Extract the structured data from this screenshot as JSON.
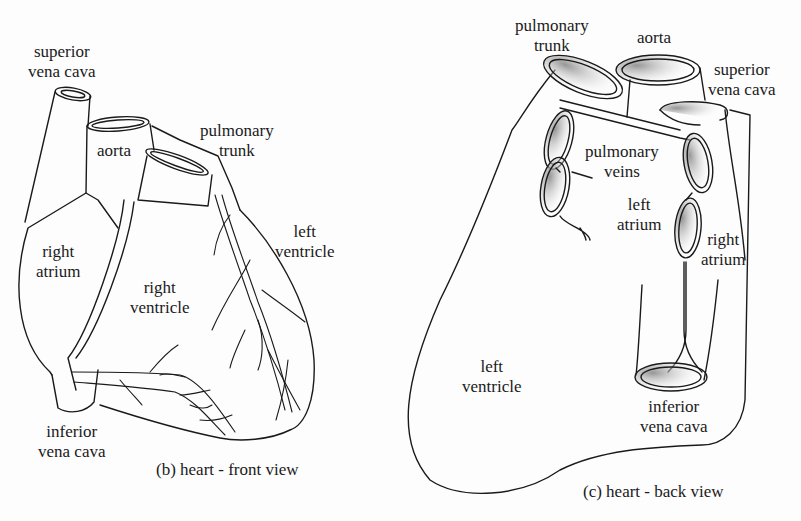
{
  "figures": [
    {
      "id": "front",
      "caption": "(b)  heart - front view",
      "labels": {
        "superior_vena_cava": [
          "superior",
          "vena cava"
        ],
        "aorta": [
          "aorta"
        ],
        "pulmonary_trunk": [
          "pulmonary",
          "trunk"
        ],
        "left_ventricle": [
          "left",
          "ventricle"
        ],
        "right_atrium": [
          "right",
          "atrium"
        ],
        "right_ventricle": [
          "right",
          "ventricle"
        ],
        "inferior_vena_cava": [
          "inferior",
          "vena cava"
        ]
      }
    },
    {
      "id": "back",
      "caption": "(c)  heart - back view",
      "labels": {
        "pulmonary_trunk": [
          "pulmonary",
          "trunk"
        ],
        "aorta": [
          "aorta"
        ],
        "superior_vena_cava": [
          "superior",
          "vena cava"
        ],
        "pulmonary_veins": [
          "pulmonary",
          "veins"
        ],
        "left_atrium": [
          "left",
          "atrium"
        ],
        "right_atrium": [
          "right",
          "atrium"
        ],
        "left_ventricle": [
          "left",
          "ventricle"
        ],
        "inferior_vena_cava": [
          "inferior",
          "vena cava"
        ]
      }
    }
  ],
  "colors": {
    "ink": "#1a1a1a",
    "paper": "#fdfdfd",
    "shade": "#9a9a9a"
  }
}
